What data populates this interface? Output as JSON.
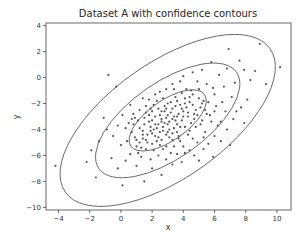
{
  "chart_data": {
    "type": "scatter",
    "title": "Dataset A with confidence contours",
    "xlabel": "x",
    "ylabel": "y",
    "xlim": [
      -4.8,
      10.9
    ],
    "ylim": [
      -10.2,
      4.2
    ],
    "xticks": [
      -4,
      -2,
      0,
      2,
      4,
      6,
      8,
      10
    ],
    "yticks": [
      4,
      2,
      0,
      -2,
      -4,
      -6,
      -8,
      -10
    ],
    "grid": false,
    "legend": null,
    "point_color": "#555555",
    "contour_color": "#555555",
    "contours": [
      {
        "name": "inner",
        "center": [
          3.0,
          -3.3
        ],
        "semi_axes_px": [
          45,
          20
        ],
        "angle_deg": -35
      },
      {
        "name": "middle",
        "center": [
          3.0,
          -3.3
        ],
        "semi_axes_px": [
          84,
          38
        ],
        "angle_deg": -35
      },
      {
        "name": "outer",
        "center": [
          3.0,
          -3.3
        ],
        "semi_axes_px": [
          125,
          58
        ],
        "angle_deg": -35
      }
    ],
    "points": [
      [
        -0.8,
        0.2
      ],
      [
        -0.3,
        -0.7
      ],
      [
        -1.9,
        -5.6
      ],
      [
        -4.2,
        -6.8
      ],
      [
        -2.2,
        -6.5
      ],
      [
        -0.6,
        -6.2
      ],
      [
        -1.6,
        -7.7
      ],
      [
        0.1,
        -8.3
      ],
      [
        1.5,
        -8.0
      ],
      [
        -0.9,
        -4.0
      ],
      [
        0.3,
        -3.9
      ],
      [
        0.7,
        -3.2
      ],
      [
        1.2,
        -2.5
      ],
      [
        1.8,
        -1.7
      ],
      [
        2.5,
        -1.1
      ],
      [
        3.3,
        -0.5
      ],
      [
        4.0,
        0.1
      ],
      [
        5.2,
        0.6
      ],
      [
        5.8,
        1.2
      ],
      [
        6.9,
        2.2
      ],
      [
        7.6,
        1.3
      ],
      [
        8.6,
        0.5
      ],
      [
        9.3,
        -0.5
      ],
      [
        10.2,
        0.8
      ],
      [
        8.1,
        -1.7
      ],
      [
        7.4,
        -2.6
      ],
      [
        6.4,
        -3.4
      ],
      [
        7.0,
        -5.2
      ],
      [
        5.0,
        -6.4
      ],
      [
        3.3,
        -6.7
      ],
      [
        2.6,
        -7.5
      ],
      [
        1.1,
        -5.8
      ],
      [
        0.4,
        -4.9
      ],
      [
        1.4,
        -4.4
      ],
      [
        1.9,
        -4.1
      ],
      [
        2.2,
        -3.6
      ],
      [
        2.6,
        -3.2
      ],
      [
        3.0,
        -2.9
      ],
      [
        3.3,
        -2.4
      ],
      [
        3.8,
        -2.1
      ],
      [
        4.1,
        -1.6
      ],
      [
        4.6,
        -1.3
      ],
      [
        5.0,
        -0.9
      ],
      [
        5.5,
        -0.5
      ],
      [
        4.8,
        -2.5
      ],
      [
        4.3,
        -3.0
      ],
      [
        3.6,
        -3.6
      ],
      [
        3.1,
        -4.0
      ],
      [
        2.4,
        -4.6
      ],
      [
        1.7,
        -5.0
      ],
      [
        1.0,
        -5.3
      ],
      [
        0.6,
        -5.9
      ],
      [
        2.9,
        -5.3
      ],
      [
        3.7,
        -4.7
      ],
      [
        4.4,
        -4.1
      ],
      [
        5.1,
        -3.6
      ],
      [
        5.7,
        -2.9
      ],
      [
        6.1,
        -2.2
      ],
      [
        6.0,
        -1.3
      ],
      [
        5.3,
        -1.8
      ],
      [
        2.0,
        -2.6
      ],
      [
        1.5,
        -3.1
      ],
      [
        2.8,
        -2.2
      ],
      [
        3.5,
        -1.5
      ],
      [
        4.2,
        -0.9
      ],
      [
        4.9,
        -0.3
      ],
      [
        2.1,
        -5.6
      ],
      [
        1.3,
        -6.1
      ],
      [
        0.9,
        -4.6
      ],
      [
        2.3,
        -4.9
      ],
      [
        3.2,
        -5.8
      ],
      [
        4.0,
        -5.3
      ],
      [
        4.6,
        -4.7
      ],
      [
        5.4,
        -4.2
      ],
      [
        6.2,
        -3.7
      ],
      [
        6.7,
        -2.6
      ],
      [
        6.5,
        -1.9
      ],
      [
        5.9,
        -0.8
      ],
      [
        3.9,
        -3.3
      ],
      [
        2.7,
        -3.8
      ],
      [
        3.4,
        -3.0
      ],
      [
        2.5,
        -2.9
      ],
      [
        1.8,
        -3.4
      ],
      [
        1.2,
        -3.9
      ],
      [
        2.0,
        -4.3
      ],
      [
        2.9,
        -4.4
      ],
      [
        3.6,
        -4.2
      ],
      [
        4.5,
        -3.5
      ],
      [
        4.7,
        -2.8
      ],
      [
        4.0,
        -2.6
      ],
      [
        3.2,
        -1.9
      ],
      [
        2.3,
        -1.8
      ],
      [
        1.6,
        -2.2
      ],
      [
        0.8,
        -2.8
      ],
      [
        0.5,
        -3.5
      ],
      [
        1.0,
        -4.8
      ],
      [
        1.6,
        -5.5
      ],
      [
        2.4,
        -6.0
      ],
      [
        3.6,
        -5.9
      ],
      [
        4.4,
        -5.6
      ],
      [
        5.6,
        -5.1
      ],
      [
        6.0,
        -4.5
      ],
      [
        6.8,
        -4.0
      ],
      [
        7.2,
        -3.2
      ],
      [
        7.7,
        -2.3
      ],
      [
        7.1,
        -1.5
      ],
      [
        6.6,
        -0.7
      ],
      [
        6.3,
        0.2
      ],
      [
        4.6,
        0.4
      ],
      [
        3.8,
        -0.3
      ],
      [
        2.9,
        -0.9
      ],
      [
        2.2,
        -1.3
      ],
      [
        1.4,
        -1.6
      ],
      [
        0.6,
        -2.1
      ],
      [
        0.1,
        -2.9
      ],
      [
        -0.2,
        -3.7
      ],
      [
        -0.5,
        -4.5
      ],
      [
        0.0,
        -5.2
      ],
      [
        0.3,
        -6.4
      ],
      [
        1.0,
        -6.8
      ],
      [
        2.0,
        -7.0
      ],
      [
        2.9,
        -6.3
      ],
      [
        3.9,
        -6.5
      ],
      [
        4.7,
        -6.0
      ],
      [
        5.3,
        -5.5
      ],
      [
        5.9,
        -6.1
      ],
      [
        2.6,
        -3.4
      ],
      [
        3.0,
        -3.6
      ],
      [
        3.4,
        -3.9
      ],
      [
        2.2,
        -3.0
      ],
      [
        2.8,
        -2.6
      ],
      [
        3.7,
        -2.8
      ],
      [
        4.2,
        -2.3
      ],
      [
        1.9,
        -3.8
      ],
      [
        2.5,
        -4.2
      ],
      [
        3.1,
        -4.6
      ],
      [
        3.8,
        -4.9
      ],
      [
        4.3,
        -4.4
      ],
      [
        1.4,
        -4.7
      ],
      [
        1.8,
        -2.9
      ],
      [
        2.4,
        -2.4
      ],
      [
        3.0,
        -2.0
      ],
      [
        3.6,
        -1.8
      ],
      [
        4.4,
        -1.9
      ],
      [
        5.1,
        -2.3
      ],
      [
        5.5,
        -2.8
      ],
      [
        5.2,
        -3.3
      ],
      [
        4.8,
        -3.8
      ],
      [
        4.1,
        -3.8
      ],
      [
        3.3,
        -4.3
      ],
      [
        2.6,
        -4.8
      ],
      [
        2.0,
        -5.1
      ],
      [
        1.3,
        -5.4
      ],
      [
        0.7,
        -4.2
      ],
      [
        1.1,
        -3.3
      ],
      [
        1.6,
        -2.7
      ],
      [
        2.9,
        -3.1
      ],
      [
        3.5,
        -3.3
      ],
      [
        4.0,
        -3.0
      ],
      [
        3.2,
        -2.7
      ],
      [
        2.3,
        -3.9
      ],
      [
        1.7,
        -4.4
      ],
      [
        4.6,
        -2.1
      ],
      [
        5.0,
        -1.6
      ],
      [
        4.5,
        -1.0
      ],
      [
        3.9,
        -1.2
      ],
      [
        3.4,
        -0.9
      ],
      [
        2.7,
        -1.6
      ],
      [
        2.1,
        -2.1
      ],
      [
        5.6,
        -1.9
      ],
      [
        6.0,
        -2.6
      ],
      [
        5.8,
        -3.4
      ],
      [
        5.3,
        -4.6
      ],
      [
        4.9,
        -5.0
      ],
      [
        4.1,
        -5.8
      ],
      [
        3.4,
        -5.3
      ],
      [
        2.7,
        -5.5
      ],
      [
        1.9,
        -6.3
      ],
      [
        1.2,
        -5.0
      ],
      [
        0.8,
        -3.6
      ],
      [
        8.3,
        -0.2
      ],
      [
        7.9,
        0.6
      ],
      [
        7.3,
        -0.4
      ],
      [
        6.8,
        0.7
      ],
      [
        8.9,
        2.6
      ],
      [
        6.4,
        -4.9
      ],
      [
        7.9,
        -3.5
      ],
      [
        -1.1,
        -3.1
      ],
      [
        -1.4,
        -4.9
      ],
      [
        -0.2,
        -7.0
      ],
      [
        3.1,
        -3.4
      ],
      [
        2.8,
        -3.5
      ],
      [
        3.3,
        -3.2
      ],
      [
        2.4,
        -3.6
      ],
      [
        3.6,
        -3.0
      ],
      [
        2.1,
        -4.0
      ],
      [
        3.9,
        -2.4
      ],
      [
        4.3,
        -2.7
      ],
      [
        2.6,
        -2.6
      ],
      [
        3.0,
        -4.2
      ],
      [
        1.5,
        -3.6
      ],
      [
        4.7,
        -3.2
      ],
      [
        2.2,
        -4.5
      ],
      [
        3.7,
        -4.5
      ],
      [
        1.9,
        -2.4
      ],
      [
        4.4,
        -1.5
      ],
      [
        5.4,
        -2.5
      ],
      [
        0.9,
        -3.1
      ],
      [
        1.4,
        -4.1
      ],
      [
        2.7,
        -4.1
      ],
      [
        3.5,
        -2.2
      ],
      [
        3.8,
        -3.8
      ],
      [
        2.9,
        -2.4
      ],
      [
        2.0,
        -3.3
      ],
      [
        4.1,
        -2.0
      ],
      [
        3.3,
        -4.8
      ],
      [
        2.5,
        -5.2
      ],
      [
        1.6,
        -4.8
      ],
      [
        4.9,
        -2.9
      ],
      [
        5.2,
        -2.0
      ]
    ]
  }
}
